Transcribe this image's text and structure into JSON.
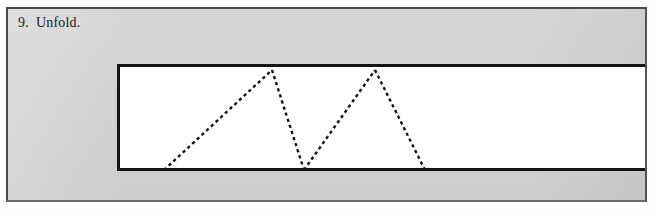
{
  "page": {
    "background_color": "#fdfdfd",
    "panel_color": "#d1d1d1",
    "ink_color": "#151515"
  },
  "caption": {
    "step_number": "9.",
    "text": "Unfold.",
    "full_text": "9. Unfold."
  },
  "figure": {
    "name": "unfolded-paper-strip",
    "paper_color": "#ffffff",
    "outline_color": "#151515",
    "crease_style": "dashed",
    "crease_color": "#111111",
    "crease_dash": "3 3",
    "crease_width": 2,
    "description": "Long horizontal paper strip with zigzag dashed crease lines",
    "strip": {
      "x": 124,
      "y": 71,
      "width": 522,
      "height": 100,
      "open_right_edge": true
    },
    "creases": [
      {
        "name": "crease-1",
        "x1": 47,
        "y1": 106,
        "x2": 155,
        "y2": 6
      },
      {
        "name": "crease-2",
        "x1": 155,
        "y1": 6,
        "x2": 187,
        "y2": 106
      },
      {
        "name": "crease-3",
        "x1": 187,
        "y1": 106,
        "x2": 258,
        "y2": 6
      },
      {
        "name": "crease-4",
        "x1": 258,
        "y1": 6,
        "x2": 308,
        "y2": 106
      }
    ],
    "crease_count": 4
  },
  "chart_data": {
    "type": "line",
    "title": "Unfold",
    "xlabel": "",
    "ylabel": "",
    "x": [
      47,
      155,
      187,
      258,
      308
    ],
    "values": [
      106,
      6,
      106,
      6,
      106
    ],
    "series": [
      {
        "name": "fold-creases",
        "values": [
          106,
          6,
          106,
          6,
          106
        ]
      }
    ],
    "categories": [
      "bottom",
      "peak",
      "valley",
      "peak",
      "bottom"
    ],
    "xlim": [
      0,
      528
    ],
    "ylim": [
      0,
      107
    ],
    "grid": false,
    "legend": "none"
  }
}
